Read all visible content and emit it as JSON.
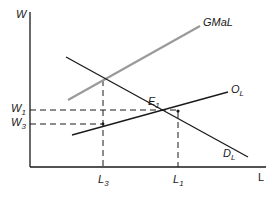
{
  "diagram": {
    "type": "labor market supply-demand diagram",
    "axes": {
      "y_label": "W",
      "x_label": "L"
    },
    "curves": [
      {
        "id": "gmal",
        "label": "GMaL",
        "color": "#9a9a9a"
      },
      {
        "id": "ol",
        "label": "O",
        "sub": "L",
        "color": "#1a1a1a"
      },
      {
        "id": "dl",
        "label": "D",
        "sub": "L",
        "color": "#1a1a1a"
      }
    ],
    "points": [
      {
        "id": "e1",
        "label": "E",
        "sub": "1"
      }
    ],
    "y_ticks": [
      {
        "label": "W",
        "sub": "1"
      },
      {
        "label": "W",
        "sub": "3"
      }
    ],
    "x_ticks": [
      {
        "label": "L",
        "sub": "3"
      },
      {
        "label": "L",
        "sub": "1"
      }
    ]
  }
}
